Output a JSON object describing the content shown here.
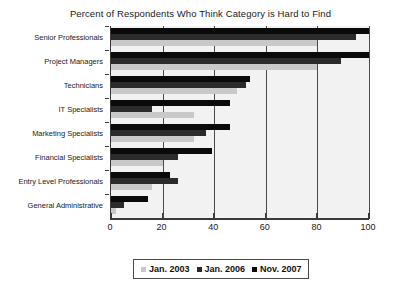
{
  "chart_data": {
    "type": "bar",
    "orientation": "horizontal",
    "title": "Percent of Respondents Who Think Category is Hard to Find",
    "xlabel": "",
    "ylabel": "",
    "xlim": [
      0,
      100
    ],
    "xticks": [
      0,
      20,
      40,
      60,
      80,
      100
    ],
    "xtick_labels": [
      "0",
      "20",
      "40",
      "60",
      "80",
      "100"
    ],
    "grid": true,
    "grid_axis": "x",
    "legend_position": "bottom",
    "categories": [
      "Senior Professionals",
      "Project Managers",
      "Technicians",
      "IT Specialists",
      "Marketing Specialists",
      "Financial Specialists",
      "Entry Level Professionals",
      "General Administrative"
    ],
    "series": [
      {
        "name": "Jan. 2003",
        "color": "#c9c9c9",
        "values": [
          80,
          80,
          49,
          32,
          32,
          20,
          16,
          2
        ]
      },
      {
        "name": "Jan. 2006",
        "color": "#2b2b2b",
        "values": [
          95,
          89,
          52.5,
          16,
          37,
          26,
          26,
          5
        ]
      },
      {
        "name": "Nov. 2007",
        "color": "#0a0a0a",
        "values": [
          100,
          100,
          54,
          46,
          46,
          39,
          23,
          14.5
        ]
      }
    ]
  },
  "legend": {
    "items": [
      {
        "label": "Jan. 2003",
        "color": "#c9c9c9"
      },
      {
        "label": "Jan. 2006",
        "color": "#2b2b2b"
      },
      {
        "label": "Nov. 2007",
        "color": "#0a0a0a"
      }
    ]
  }
}
